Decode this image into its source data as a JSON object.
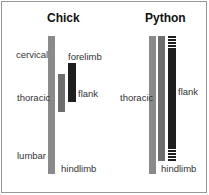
{
  "panels": [
    {
      "title": "Chick",
      "labels": {
        "cervical": "cervical",
        "thoracic": "thoracic",
        "lumbar": "lumbar",
        "forelimb": "forelimb",
        "flank": "flank",
        "hindlimb": "hindlimb"
      }
    },
    {
      "title": "Python",
      "labels": {
        "thoracic": "thoracic",
        "flank": "flank",
        "hindlimb": "hindlimb"
      }
    }
  ],
  "colors": {
    "axial_bar": "#8a8a8a",
    "mid_bar": "#6e6e6e",
    "dark_bar": "#1e1e1e",
    "border": "#999999"
  }
}
